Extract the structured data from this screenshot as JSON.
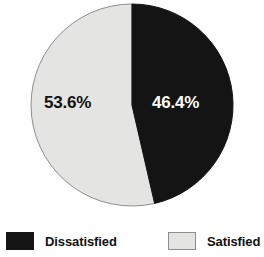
{
  "chart_data": {
    "type": "pie",
    "title": "",
    "subtitle": "",
    "xlabel": "",
    "ylabel": "",
    "grid": false,
    "legend_position": "bottom",
    "start_angle_deg": 0,
    "direction": "clockwise",
    "categories": [
      "Dissatisfied",
      "Satisfied"
    ],
    "values": [
      46.4,
      53.6
    ],
    "unit": "%",
    "slices": [
      {
        "label": "Dissatisfied",
        "value": 46.4,
        "data_label": "46.4%",
        "color": "#141414",
        "label_color": "#ffffff",
        "edge_color": "#141414"
      },
      {
        "label": "Satisfied",
        "value": 53.6,
        "data_label": "53.6%",
        "color": "#e4e4e2",
        "label_color": "#111111",
        "edge_color": "#8d8d8d"
      }
    ],
    "annotations": []
  },
  "pie": {
    "labels": {
      "satisfied": "53.6%",
      "dissatisfied": "46.4%"
    }
  },
  "legend": {
    "items": [
      {
        "label": "Dissatisfied",
        "swatch_color": "#141414",
        "swatch_border": "#141414",
        "swatch_name": "legend-swatch-dissatisfied"
      },
      {
        "label": "Satisfied",
        "swatch_color": "#e4e4e2",
        "swatch_border": "#8d8d8d",
        "swatch_name": "legend-swatch-satisfied"
      }
    ]
  },
  "colors": {
    "background": "#ffffff",
    "dark_slice": "#141414",
    "light_slice": "#e4e4e2",
    "outline": "#8d8d8d",
    "text": "#111111",
    "inverse_text": "#ffffff"
  }
}
